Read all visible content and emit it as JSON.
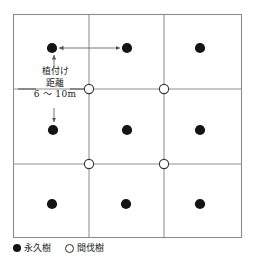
{
  "diagram": {
    "title": "",
    "plot": {
      "border": {
        "x": 13,
        "y": 14,
        "width": 229,
        "height": 224,
        "color": "#8c8c8c"
      },
      "grid": {
        "vertical_x": [
          89,
          164
        ],
        "horizontal_y": [
          89,
          164
        ],
        "color": "#8f8f8f",
        "visible": true
      },
      "permanent_trees": {
        "symbol": "filled-circle",
        "color": "#141414",
        "radius": 5,
        "points": [
          {
            "x": 52,
            "y": 48
          },
          {
            "x": 127,
            "y": 48
          },
          {
            "x": 200,
            "y": 48
          },
          {
            "x": 53,
            "y": 130
          },
          {
            "x": 127,
            "y": 130
          },
          {
            "x": 200,
            "y": 130
          },
          {
            "x": 52,
            "y": 204
          },
          {
            "x": 126,
            "y": 204
          },
          {
            "x": 200,
            "y": 204
          }
        ]
      },
      "thinning_trees": {
        "symbol": "open-circle",
        "color": "#3a3a3a",
        "radius": 4.6,
        "points": [
          {
            "x": 89,
            "y": 89
          },
          {
            "x": 164,
            "y": 89
          },
          {
            "x": 89,
            "y": 164
          },
          {
            "x": 164,
            "y": 164
          }
        ]
      }
    },
    "annotation": {
      "line1": "植付け",
      "line2": "距離",
      "line3": "6 〜 10m",
      "arrow_color": "#555555",
      "horizontal_arrow": {
        "x1": 58,
        "x2": 121,
        "y": 48,
        "double_headed": true
      },
      "arrow_up": {
        "x": 54,
        "y1": 67,
        "y2": 55
      },
      "arrow_down": {
        "x": 54,
        "y1": 109,
        "y2": 123
      }
    },
    "legend": {
      "items": [
        {
          "symbol": "filled-circle",
          "label": "永久樹"
        },
        {
          "symbol": "open-circle",
          "label": "間伐樹"
        }
      ]
    }
  }
}
